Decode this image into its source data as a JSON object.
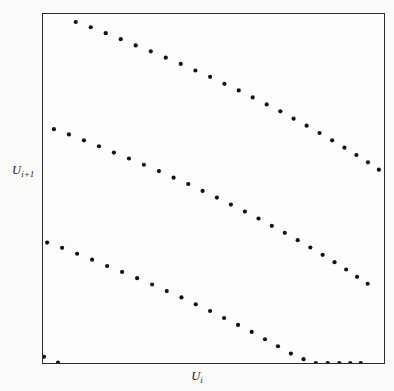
{
  "figure": {
    "type": "scatter-return-map",
    "background_color": "#fbfbfa",
    "frame_color": "#2b2b2b",
    "point_color": "#111111"
  },
  "axes": {
    "xlabel_base": "U",
    "xlabel_sub": "i",
    "ylabel_base": "U",
    "ylabel_sub": "i+1",
    "xlabel_full": "Ui",
    "ylabel_full": "Ui+1"
  },
  "chart_data": {
    "type": "scatter",
    "title": "",
    "xlabel": "U_i",
    "ylabel": "U_{i+1}",
    "xlim": [
      0,
      1
    ],
    "ylim": [
      0,
      1
    ],
    "grid": false,
    "legend": null,
    "marker": "filled-circle",
    "marker_size_px": 4.2,
    "series": [
      {
        "name": "branch-1-upper",
        "color": "#111111",
        "points": [
          [
            0.096,
            0.977
          ],
          [
            0.14,
            0.962
          ],
          [
            0.184,
            0.945
          ],
          [
            0.228,
            0.928
          ],
          [
            0.272,
            0.91
          ],
          [
            0.316,
            0.893
          ],
          [
            0.36,
            0.875
          ],
          [
            0.404,
            0.857
          ],
          [
            0.447,
            0.838
          ],
          [
            0.49,
            0.82
          ],
          [
            0.532,
            0.8
          ],
          [
            0.574,
            0.781
          ],
          [
            0.615,
            0.761
          ],
          [
            0.656,
            0.741
          ],
          [
            0.696,
            0.721
          ],
          [
            0.735,
            0.7
          ],
          [
            0.773,
            0.68
          ],
          [
            0.811,
            0.659
          ],
          [
            0.848,
            0.638
          ],
          [
            0.884,
            0.617
          ],
          [
            0.919,
            0.596
          ],
          [
            0.953,
            0.575
          ],
          [
            0.985,
            0.554
          ]
        ]
      },
      {
        "name": "branch-2-middle",
        "color": "#111111",
        "points": [
          [
            0.032,
            0.67
          ],
          [
            0.076,
            0.655
          ],
          [
            0.12,
            0.638
          ],
          [
            0.164,
            0.621
          ],
          [
            0.208,
            0.603
          ],
          [
            0.252,
            0.586
          ],
          [
            0.296,
            0.568
          ],
          [
            0.34,
            0.55
          ],
          [
            0.383,
            0.531
          ],
          [
            0.426,
            0.513
          ],
          [
            0.468,
            0.493
          ],
          [
            0.51,
            0.474
          ],
          [
            0.551,
            0.454
          ],
          [
            0.592,
            0.434
          ],
          [
            0.632,
            0.414
          ],
          [
            0.671,
            0.393
          ],
          [
            0.709,
            0.373
          ],
          [
            0.747,
            0.352
          ],
          [
            0.784,
            0.331
          ],
          [
            0.82,
            0.31
          ],
          [
            0.855,
            0.289
          ],
          [
            0.889,
            0.268
          ],
          [
            0.921,
            0.247
          ],
          [
            0.952,
            0.227
          ]
        ]
      },
      {
        "name": "branch-3-lower",
        "color": "#111111",
        "points": [
          [
            0.012,
            0.345
          ],
          [
            0.056,
            0.33
          ],
          [
            0.1,
            0.313
          ],
          [
            0.144,
            0.296
          ],
          [
            0.188,
            0.278
          ],
          [
            0.232,
            0.261
          ],
          [
            0.276,
            0.243
          ],
          [
            0.32,
            0.225
          ],
          [
            0.363,
            0.206
          ],
          [
            0.406,
            0.188
          ],
          [
            0.448,
            0.168
          ],
          [
            0.49,
            0.149
          ],
          [
            0.531,
            0.129
          ],
          [
            0.572,
            0.109
          ],
          [
            0.612,
            0.089
          ],
          [
            0.651,
            0.068
          ],
          [
            0.689,
            0.048
          ],
          [
            0.727,
            0.027
          ],
          [
            0.764,
            0.011
          ],
          [
            0.8,
            0.0
          ],
          [
            0.835,
            0.0
          ],
          [
            0.869,
            0.0
          ],
          [
            0.901,
            0.0
          ],
          [
            0.932,
            0.0
          ]
        ]
      },
      {
        "name": "corner-points",
        "color": "#111111",
        "points": [
          [
            0.003,
            0.018
          ],
          [
            0.044,
            0.001
          ]
        ]
      }
    ]
  }
}
